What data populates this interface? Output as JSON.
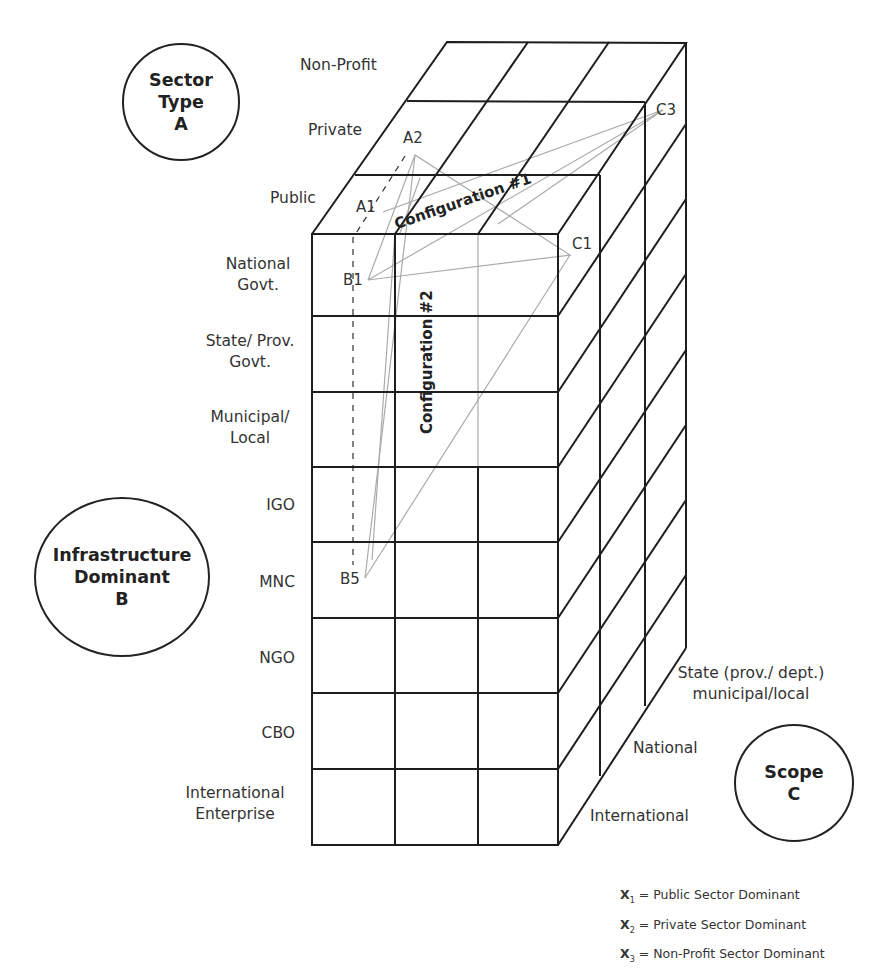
{
  "axes": {
    "sector_type": {
      "title_line1": "Sector",
      "title_line2": "Type",
      "letter": "A",
      "levels": [
        "Non-Profit",
        "Private",
        "Public"
      ]
    },
    "infrastructure_dominant": {
      "title_line1": "Infrastructure",
      "title_line2": "Dominant",
      "letter": "B",
      "levels": [
        {
          "line1": "National",
          "line2": "Govt."
        },
        {
          "line1": "State/ Prov.",
          "line2": "Govt."
        },
        {
          "line1": "Municipal/",
          "line2": "Local"
        },
        {
          "line1": "IGO",
          "line2": ""
        },
        {
          "line1": "MNC",
          "line2": ""
        },
        {
          "line1": "NGO",
          "line2": ""
        },
        {
          "line1": "CBO",
          "line2": ""
        },
        {
          "line1": "International",
          "line2": "Enterprise"
        }
      ]
    },
    "scope": {
      "title_line1": "Scope",
      "letter": "C",
      "levels": [
        {
          "line1": "State (prov./ dept.)",
          "line2": "municipal/local"
        },
        {
          "line1": "National",
          "line2": ""
        },
        {
          "line1": "International",
          "line2": ""
        }
      ]
    }
  },
  "points": {
    "A1": "A1",
    "A2": "A2",
    "B1": "B1",
    "B5": "B5",
    "C1": "C1",
    "C3": "C3"
  },
  "configurations": {
    "c1": "Configuration #1",
    "c2": "Configuration #2"
  },
  "legend": [
    {
      "symbol": "X",
      "sub": "1",
      "text": " = Public Sector Dominant"
    },
    {
      "symbol": "X",
      "sub": "2",
      "text": " = Private Sector Dominant"
    },
    {
      "symbol": "X",
      "sub": "3",
      "text": " = Non-Profit Sector Dominant"
    }
  ],
  "colors": {
    "grid": "#1e1e1e",
    "config_lines": "#a8a8a8"
  }
}
